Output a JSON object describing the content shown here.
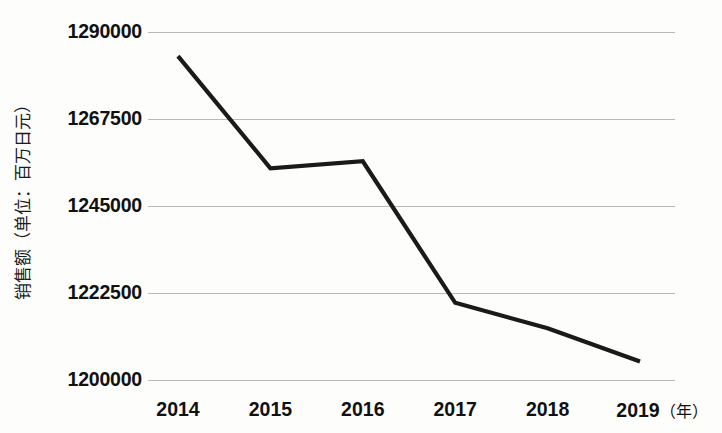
{
  "chart_data": {
    "type": "line",
    "title": "",
    "subtitle": "",
    "xlabel": "年",
    "ylabel": "销售额（单位：百万日元）",
    "categories": [
      "2014",
      "2015",
      "2016",
      "2017",
      "2018",
      "2019"
    ],
    "x": [
      2014,
      2015,
      2016,
      2017,
      2018,
      2019
    ],
    "values": [
      1283900,
      1254900,
      1256700,
      1220100,
      1213500,
      1204900
    ],
    "series": [
      {
        "name": "销售额",
        "values": [
          1283900,
          1254900,
          1256700,
          1220100,
          1213500,
          1204900
        ]
      }
    ],
    "ylim": [
      1200000,
      1290000
    ],
    "yticks": [
      1290000,
      1267500,
      1245000,
      1222500,
      1200000
    ],
    "ytick_labels": [
      "1290000",
      "1267500",
      "1245000",
      "1222500",
      "1200000"
    ],
    "xtick_labels": [
      "2014",
      "2015",
      "2016",
      "2017",
      "2018",
      "2019"
    ],
    "grid": true,
    "grid_axis": "y",
    "legend": false,
    "legend_position": "none",
    "line_color": "#1a1a1a",
    "grid_color": "#b9b9b9",
    "background_color": "#fdfdfc",
    "text_color": "#111111",
    "annotations": []
  },
  "axes": {
    "y_title": "销售额（单位：百万日元）",
    "x_unit_label": "（年）",
    "y_ticks": [
      {
        "label": "1290000",
        "value": 1290000
      },
      {
        "label": "1267500",
        "value": 1267500
      },
      {
        "label": "1245000",
        "value": 1245000
      },
      {
        "label": "1222500",
        "value": 1222500
      },
      {
        "label": "1200000",
        "value": 1200000
      }
    ],
    "x_ticks": [
      {
        "label": "2014"
      },
      {
        "label": "2015"
      },
      {
        "label": "2016"
      },
      {
        "label": "2017"
      },
      {
        "label": "2018"
      },
      {
        "label": "2019"
      }
    ]
  }
}
